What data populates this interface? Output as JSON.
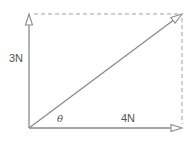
{
  "diagram": {
    "type": "vector-resolution",
    "labels": {
      "vertical": "3N",
      "horizontal": "4N",
      "angle": "θ"
    },
    "colors": {
      "line": "#8a8a8a",
      "dashed": "#a0a0a0",
      "text": "#555555"
    },
    "vectors": [
      {
        "name": "vertical",
        "magnitude_label": "3N"
      },
      {
        "name": "horizontal",
        "magnitude_label": "4N"
      },
      {
        "name": "resultant",
        "magnitude_label": ""
      }
    ]
  }
}
